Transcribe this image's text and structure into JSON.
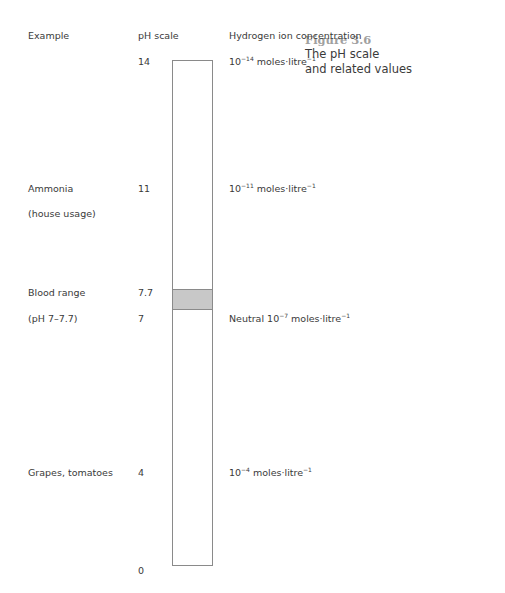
{
  "figure": {
    "number": "Figure 3.6",
    "title_line1": "The pH scale",
    "title_line2": "and related values"
  },
  "headers": {
    "example": "Example",
    "ph_scale": "pH scale",
    "concentration": "Hydrogen ion concentration"
  },
  "rows": [
    {
      "example": "",
      "example2": "",
      "ph": "14",
      "conc_prefix": "",
      "conc_base": "10",
      "conc_exp": "−14",
      "conc_unit": " moles·litre",
      "conc_unit_exp": "−1"
    },
    {
      "example": "Ammonia",
      "example2": "(house usage)",
      "ph": "11",
      "conc_prefix": "",
      "conc_base": "10",
      "conc_exp": "−11",
      "conc_unit": " moles·litre",
      "conc_unit_exp": "−1"
    },
    {
      "example": "Blood range",
      "example2": "",
      "ph": "7.7",
      "conc_prefix": "",
      "conc_base": "",
      "conc_exp": "",
      "conc_unit": "",
      "conc_unit_exp": ""
    },
    {
      "example": "(pH 7–7.7)",
      "example2": "",
      "ph": "7",
      "conc_prefix": "Neutral ",
      "conc_base": "10",
      "conc_exp": "−7",
      "conc_unit": " moles·litre",
      "conc_unit_exp": "−1"
    },
    {
      "example": "Grapes, tomatoes",
      "example2": "",
      "ph": "4",
      "conc_prefix": "",
      "conc_base": "10",
      "conc_exp": "−4",
      "conc_unit": " moles·litre",
      "conc_unit_exp": "−1"
    },
    {
      "example": "",
      "example2": "",
      "ph": "0",
      "conc_prefix": "",
      "conc_base": "",
      "conc_exp": "",
      "conc_unit": "",
      "conc_unit_exp": ""
    }
  ],
  "scale": {
    "min": 0,
    "max": 14,
    "highlight_range": [
      7,
      7.7
    ],
    "highlight_color": "#c8c8c8",
    "bar_border_color": "#8a8a8a"
  }
}
